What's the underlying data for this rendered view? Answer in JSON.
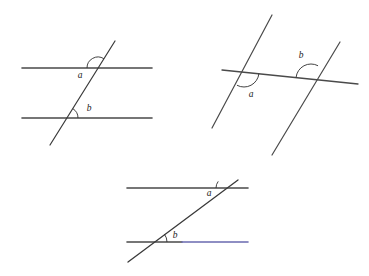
{
  "page": {
    "background_color": "#ffffff",
    "width": 369,
    "height": 276
  },
  "palette": {
    "line_dark": "#4a4a4a",
    "line_transversal": "#3a3a3a",
    "line_blue": "#6a6ab0",
    "label_color": "#1b1b1b",
    "arc_color": "#2e2e2e"
  },
  "figures": [
    {
      "id": "figure-1",
      "name": "two-horizontal-parallels-with-transversal",
      "description": "Two horizontal parallel lines crossed by a transversal leaning right",
      "lines": [
        {
          "name": "upper-parallel-line",
          "x1": 22,
          "y1": 68,
          "x2": 152,
          "y2": 68,
          "color": "#4a4a4a",
          "width": 1.6
        },
        {
          "name": "lower-parallel-line",
          "x1": 22,
          "y1": 118,
          "x2": 152,
          "y2": 118,
          "color": "#4a4a4a",
          "width": 1.6
        },
        {
          "name": "transversal-line",
          "x1": 115,
          "y1": 41,
          "x2": 50,
          "y2": 145,
          "color": "#3a3a3a",
          "width": 1.2
        }
      ],
      "angles": [
        {
          "name": "angle-a",
          "label": "a",
          "vertex_x": 98,
          "vertex_y": 68,
          "radius": 11,
          "start_deg": 180,
          "end_deg": 302,
          "label_x": 80,
          "label_y": 78
        },
        {
          "name": "angle-b",
          "label": "b",
          "vertex_x": 67,
          "vertex_y": 118,
          "radius": 11,
          "start_deg": 302,
          "end_deg": 360,
          "label_x": 89,
          "label_y": 111
        }
      ]
    },
    {
      "id": "figure-2",
      "name": "two-slanted-parallels-with-near-horizontal-transversal",
      "description": "Two steep parallel lines crossed by a nearly horizontal transversal",
      "lines": [
        {
          "name": "left-parallel-line",
          "x1": 272,
          "y1": 15,
          "x2": 212,
          "y2": 128,
          "color": "#4a4a4a",
          "width": 1.2
        },
        {
          "name": "right-parallel-line",
          "x1": 340,
          "y1": 42,
          "x2": 272,
          "y2": 155,
          "color": "#4a4a4a",
          "width": 1.2
        },
        {
          "name": "transversal-line",
          "x1": 222,
          "y1": 70,
          "x2": 358,
          "y2": 84,
          "color": "#4a4a4a",
          "width": 1.3
        }
      ],
      "angles": [
        {
          "name": "angle-a",
          "label": "a",
          "vertex_x": 244,
          "vertex_y": 72,
          "radius": 15,
          "start_deg": 6,
          "end_deg": 118,
          "label_x": 251,
          "label_y": 97
        },
        {
          "name": "angle-b",
          "label": "b",
          "vertex_x": 311,
          "vertex_y": 79,
          "radius": 15,
          "start_deg": 186,
          "end_deg": 298,
          "label_x": 301,
          "label_y": 58
        }
      ]
    },
    {
      "id": "figure-3",
      "name": "two-horizontal-parallels-with-steep-transversal",
      "description": "Two horizontal lines, lower one blue on the right, crossed by a transversal rising to the right",
      "lines": [
        {
          "name": "upper-parallel-line",
          "x1": 127,
          "y1": 188,
          "x2": 248,
          "y2": 188,
          "color": "#4a4a4a",
          "width": 1.6
        },
        {
          "name": "lower-parallel-line-gray-segment",
          "x1": 127,
          "y1": 242,
          "x2": 182,
          "y2": 242,
          "color": "#4a4a4a",
          "width": 1.6
        },
        {
          "name": "lower-parallel-line-blue-segment",
          "x1": 182,
          "y1": 242,
          "x2": 248,
          "y2": 242,
          "color": "#6a6ab0",
          "width": 1.6
        },
        {
          "name": "transversal-line",
          "x1": 238,
          "y1": 180,
          "x2": 128,
          "y2": 262,
          "color": "#3a3a3a",
          "width": 1.3
        }
      ],
      "angles": [
        {
          "name": "angle-a",
          "label": "a",
          "vertex_x": 227,
          "vertex_y": 188,
          "radius": 11,
          "start_deg": 180,
          "end_deg": 217,
          "label_x": 209,
          "label_y": 196
        },
        {
          "name": "angle-b",
          "label": "b",
          "vertex_x": 154,
          "vertex_y": 242,
          "radius": 13,
          "start_deg": 323,
          "end_deg": 360,
          "label_x": 175,
          "label_y": 238
        }
      ]
    }
  ]
}
